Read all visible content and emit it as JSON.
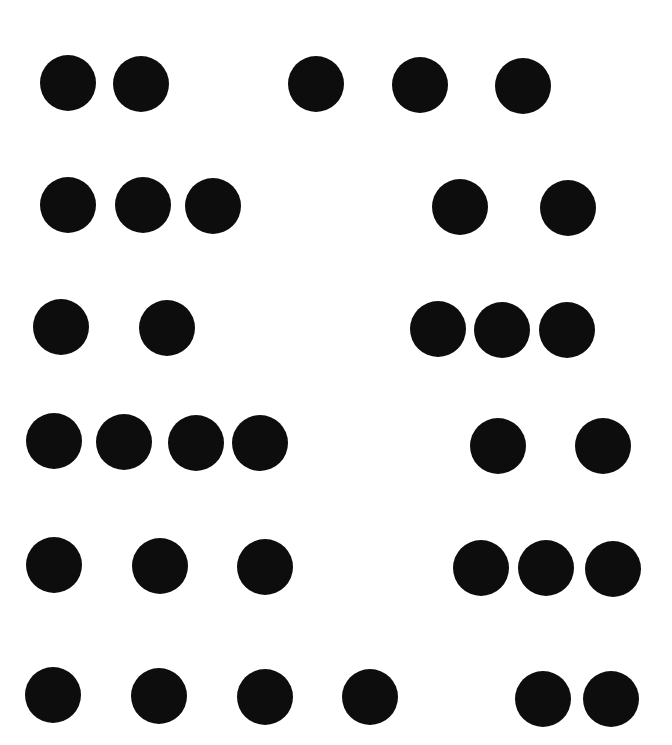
{
  "canvas": {
    "width": 672,
    "height": 745,
    "background": "#ffffff",
    "dot_color": "#0d0d0d",
    "dot_diameter": 56
  },
  "rows": [
    {
      "index": 1,
      "left_group": {
        "count": 2,
        "dots": [
          [
            68,
            83
          ],
          [
            141,
            84
          ]
        ]
      },
      "right_group": {
        "count": 3,
        "dots": [
          [
            316,
            84
          ],
          [
            420,
            85
          ],
          [
            523,
            86
          ]
        ]
      }
    },
    {
      "index": 2,
      "left_group": {
        "count": 3,
        "dots": [
          [
            68,
            205
          ],
          [
            143,
            205
          ],
          [
            213,
            206
          ]
        ]
      },
      "right_group": {
        "count": 2,
        "dots": [
          [
            460,
            207
          ],
          [
            568,
            208
          ]
        ]
      }
    },
    {
      "index": 3,
      "left_group": {
        "count": 2,
        "dots": [
          [
            61,
            327
          ],
          [
            167,
            328
          ]
        ]
      },
      "right_group": {
        "count": 3,
        "dots": [
          [
            438,
            329
          ],
          [
            502,
            330
          ],
          [
            567,
            330
          ]
        ]
      }
    },
    {
      "index": 4,
      "left_group": {
        "count": 4,
        "dots": [
          [
            54,
            441
          ],
          [
            124,
            442
          ],
          [
            196,
            443
          ],
          [
            260,
            443
          ]
        ]
      },
      "right_group": {
        "count": 2,
        "dots": [
          [
            498,
            446
          ],
          [
            603,
            446
          ]
        ]
      }
    },
    {
      "index": 5,
      "left_group": {
        "count": 3,
        "dots": [
          [
            54,
            565
          ],
          [
            160,
            566
          ],
          [
            265,
            567
          ]
        ]
      },
      "right_group": {
        "count": 3,
        "dots": [
          [
            481,
            568
          ],
          [
            546,
            568
          ],
          [
            613,
            569
          ]
        ]
      }
    },
    {
      "index": 6,
      "left_group": {
        "count": 4,
        "dots": [
          [
            53,
            695
          ],
          [
            159,
            696
          ],
          [
            265,
            697
          ],
          [
            370,
            697
          ]
        ]
      },
      "right_group": {
        "count": 2,
        "dots": [
          [
            543,
            699
          ],
          [
            611,
            699
          ]
        ]
      }
    }
  ]
}
